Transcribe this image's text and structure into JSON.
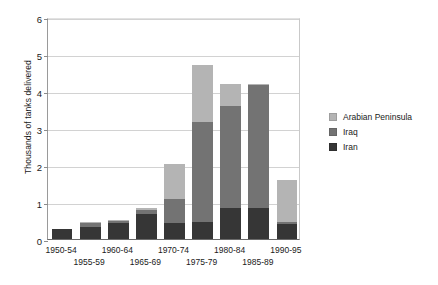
{
  "chart_data": {
    "type": "bar",
    "stacked": true,
    "title": "",
    "xlabel": "",
    "ylabel": "Thousands of tanks delivered",
    "ylim": [
      0,
      6
    ],
    "yticks": [
      0,
      1,
      2,
      3,
      4,
      5,
      6
    ],
    "ytick_labels": [
      "0",
      "1",
      "2",
      "3",
      "4",
      "5",
      "6"
    ],
    "grid": "horizontal",
    "legend_position": "right",
    "categories": [
      "1950-54",
      "1955-59",
      "1960-64",
      "1965-69",
      "1970-74",
      "1975-79",
      "1980-84",
      "1985-89",
      "1990-95"
    ],
    "category_rows": [
      0,
      1,
      0,
      1,
      0,
      1,
      0,
      1,
      0
    ],
    "series": [
      {
        "name": "Iran",
        "color": "#363636",
        "values": [
          0.28,
          0.32,
          0.42,
          0.68,
          0.42,
          0.45,
          0.85,
          0.85,
          0.4
        ]
      },
      {
        "name": "Iraq",
        "color": "#737373",
        "values": [
          0.0,
          0.1,
          0.07,
          0.1,
          0.65,
          2.7,
          2.75,
          3.3,
          0.05
        ]
      },
      {
        "name": "Arabian Peninsula",
        "color": "#b4b4b4",
        "values": [
          0.0,
          0.03,
          0.03,
          0.05,
          0.95,
          1.55,
          0.6,
          0.05,
          1.15
        ]
      }
    ],
    "totals": [
      0.28,
      0.45,
      0.52,
      0.83,
      2.02,
      4.7,
      4.2,
      4.2,
      1.6
    ]
  },
  "legend": {
    "entries": [
      {
        "label": "Arabian Peninsula",
        "color": "#b4b4b4"
      },
      {
        "label": "Iraq",
        "color": "#737373"
      },
      {
        "label": "Iran",
        "color": "#363636"
      }
    ]
  }
}
